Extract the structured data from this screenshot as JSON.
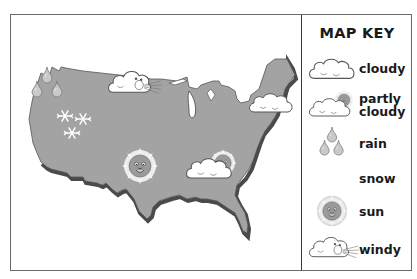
{
  "map": {
    "region": "United States",
    "land_color": "#a3a3a3",
    "edge_color": "#5a5a5a",
    "symbols": [
      {
        "type": "rain",
        "location": "Northwest"
      },
      {
        "type": "snow",
        "location": "West / Rockies"
      },
      {
        "type": "windy",
        "location": "Northern Plains"
      },
      {
        "type": "cloudy",
        "location": "Northeast"
      },
      {
        "type": "sun",
        "location": "Southwest / Central"
      },
      {
        "type": "partly cloudy",
        "location": "Southeast"
      }
    ]
  },
  "key": {
    "title": "MAP KEY",
    "items": [
      {
        "id": "cloudy",
        "label": "cloudy",
        "icon": "cloud-icon"
      },
      {
        "id": "partly_cloudy",
        "label_line1": "partly",
        "label_line2": "cloudy",
        "icon": "partly-cloudy-icon"
      },
      {
        "id": "rain",
        "label": "rain",
        "icon": "raindrop-icon"
      },
      {
        "id": "snow",
        "label": "snow",
        "icon": "snowflake-icon"
      },
      {
        "id": "sun",
        "label": "sun",
        "icon": "sun-icon"
      },
      {
        "id": "windy",
        "label": "windy",
        "icon": "windy-cloud-icon"
      }
    ]
  }
}
